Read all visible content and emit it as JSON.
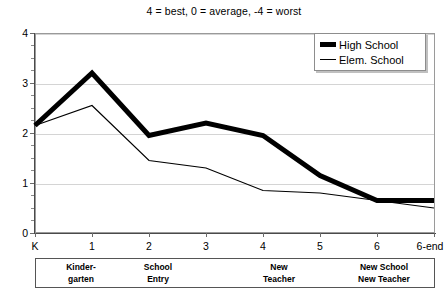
{
  "chart_data": {
    "type": "line",
    "title": "4 = best, 0 = average, -4 = worst",
    "xlabel": "",
    "ylabel": "",
    "categories": [
      "K",
      "1",
      "2",
      "3",
      "4",
      "5",
      "6",
      "6-end"
    ],
    "ylim": [
      0,
      4
    ],
    "xlim_labels": [
      "K",
      "6-end"
    ],
    "yticks": [
      "0",
      "1",
      "2",
      "3",
      "4"
    ],
    "grid": true,
    "legend_position": "top-right",
    "series": [
      {
        "name": "High School",
        "style": "thick-black-line",
        "values": [
          2.15,
          3.2,
          1.95,
          2.2,
          1.95,
          1.15,
          0.65,
          0.65
        ]
      },
      {
        "name": "Elem. School",
        "style": "thin-black-line",
        "values": [
          2.15,
          2.55,
          1.45,
          1.3,
          0.85,
          0.8,
          0.65,
          0.5
        ]
      }
    ],
    "annotations": [
      {
        "label_line1": "Kinder-",
        "label_line2": "garten",
        "at_category": "K"
      },
      {
        "label_line1": "School",
        "label_line2": "Entry",
        "at_category": "1"
      },
      {
        "label_line1": "New",
        "label_line2": "Teacher",
        "at_category": "3"
      },
      {
        "label_line1": "New School",
        "label_line2": "New Teacher",
        "at_category": "5"
      }
    ]
  },
  "legend": {
    "items": [
      {
        "label": "High School"
      },
      {
        "label": "Elem. School"
      }
    ]
  },
  "colors": {
    "series_high_school": "#000000",
    "series_elem_school": "#000000",
    "grid": "#d4d4d4",
    "axis": "#4a4a4a",
    "background": "#ffffff"
  }
}
